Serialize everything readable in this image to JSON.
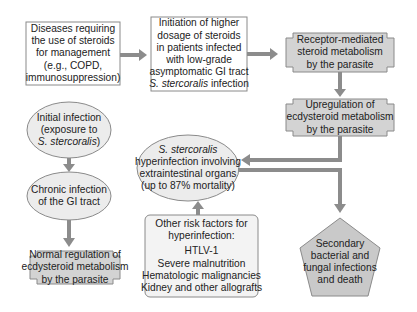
{
  "diagram": {
    "colors": {
      "box_fill": "#ffffff",
      "shaded_fill": "#d3d3d3",
      "light_fill": "#f2f2f2",
      "border": "#8a8a8a",
      "arrow": "#8c8c8c",
      "text": "#222222"
    },
    "nodes": {
      "steroid_diseases": {
        "shape": "rectangle",
        "lines": [
          "Diseases requiring",
          "the use of steroids",
          "for management",
          "(e.g., COPD,",
          "immunosuppression)"
        ]
      },
      "steroid_initiation": {
        "shape": "rectangle",
        "lines": [
          "Initiation of higher",
          "dosage of steroids",
          "in patients infected",
          "with low-grade",
          "asymptomatic GI tract"
        ],
        "italic_line": "S. stercoralis",
        "tail_line": " infection"
      },
      "receptor_metabolism": {
        "shape": "banner",
        "lines": [
          "Receptor-mediated",
          "steroid metabolism",
          "by the parasite"
        ]
      },
      "upregulation": {
        "shape": "banner",
        "lines": [
          "Upregulation of",
          "ecdysteroid metabolism",
          "by the parasite"
        ]
      },
      "initial_infection": {
        "shape": "ellipse",
        "lines": [
          "Initial infection",
          "(exposure to"
        ],
        "italic_line": "S. stercoralis",
        "tail_line": ")"
      },
      "chronic_infection": {
        "shape": "ellipse",
        "lines": [
          "Chronic infection",
          "of the GI tract"
        ]
      },
      "hyperinfection": {
        "shape": "ellipse",
        "italic_line": "S. stercoralis",
        "lines": [
          "hyperinfection involving",
          "extraintestinal organs",
          "(up to 87% mortality)"
        ]
      },
      "normal_regulation": {
        "shape": "banner",
        "lines": [
          "Normal regulation of",
          "ecdysteroid metabolism",
          "by the parasite"
        ]
      },
      "risk_factors": {
        "shape": "rounded-rectangle",
        "lines": [
          "Other risk factors for",
          "hyperinfection:",
          "HTLV-1",
          "Severe malnutrition",
          "Hematologic malignancies",
          "Kidney and other allografts"
        ]
      },
      "outcome": {
        "shape": "pentagon",
        "lines": [
          "Secondary",
          "bacterial and",
          "fungal infections",
          "and death"
        ]
      }
    },
    "edges": [
      {
        "from": "steroid_diseases",
        "to": "steroid_initiation"
      },
      {
        "from": "steroid_initiation",
        "to": "receptor_metabolism"
      },
      {
        "from": "receptor_metabolism",
        "to": "upregulation"
      },
      {
        "from": "upregulation",
        "to": "hyperinfection"
      },
      {
        "from": "hyperinfection",
        "to": "outcome"
      },
      {
        "from": "initial_infection",
        "to": "chronic_infection"
      },
      {
        "from": "chronic_infection",
        "to": "normal_regulation"
      },
      {
        "from": "risk_factors",
        "to": "hyperinfection"
      }
    ]
  }
}
